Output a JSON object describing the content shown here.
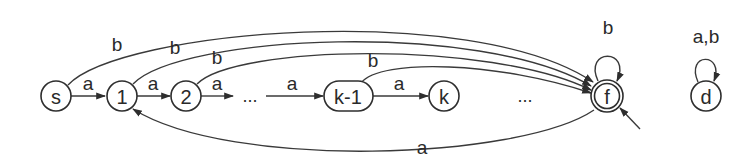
{
  "diagram": {
    "type": "finite-automaton",
    "states": {
      "s": "s",
      "q1": "1",
      "q2": "2",
      "qk1": "k-1",
      "qk": "k",
      "f": "f",
      "d": "d"
    },
    "ellipsis": {
      "middle": "...",
      "right": "..."
    },
    "edges": {
      "s_to_1": "a",
      "q1_to_2": "a",
      "q2_to_dots": "a",
      "dots_to_k1": "a",
      "k1_to_k": "a",
      "s_to_f": "b",
      "q1_to_f": "b",
      "q2_to_f": "b",
      "k1_to_f": "b",
      "f_loop": "b",
      "f_to_1": "a",
      "d_loop": "a,b"
    },
    "accepting_state": "f",
    "start_arrow_target": "f"
  }
}
